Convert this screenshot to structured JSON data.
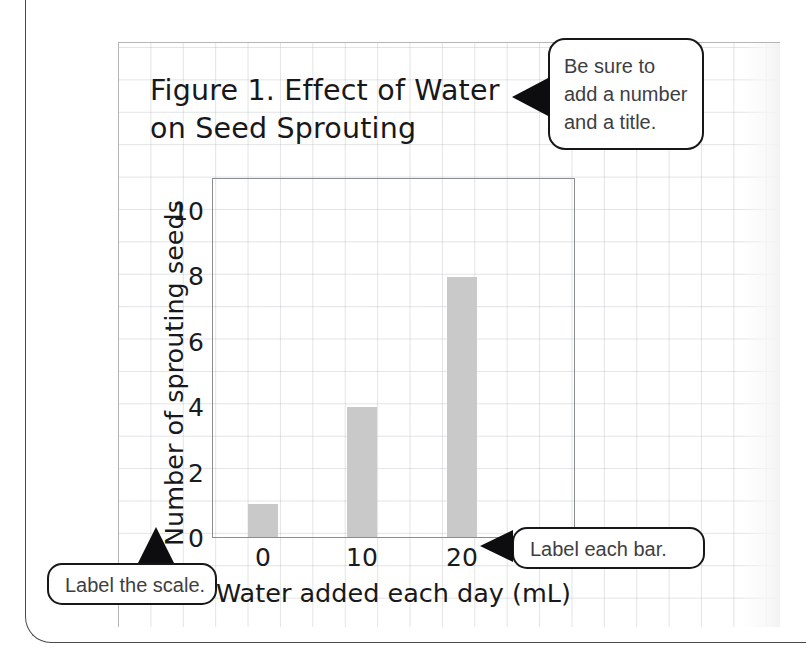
{
  "figure": {
    "title_line1": "Figure 1. Effect of Water",
    "title_line2": "on Seed Sprouting"
  },
  "chart_data": {
    "type": "bar",
    "title": "Figure 1. Effect of Water on Seed Sprouting",
    "categories": [
      "0",
      "10",
      "20"
    ],
    "values": [
      1,
      4,
      8
    ],
    "xlabel": "Water added each day (mL)",
    "ylabel": "Number of sprouting seeds",
    "ylim": [
      0,
      11
    ],
    "yticks": [
      "0",
      "2",
      "4",
      "6",
      "8",
      "10"
    ],
    "ytick_values": [
      0,
      2,
      4,
      6,
      8,
      10
    ],
    "grid": false,
    "legend": false,
    "bar_color": "#c9c9c9",
    "frame_color": "#8b8d8f"
  },
  "callouts": {
    "title_note": {
      "line1": "Be sure to",
      "line2": "add a number",
      "line3": "and a title."
    },
    "scale_note": {
      "text": "Label the scale."
    },
    "bar_note": {
      "text": "Label each bar."
    }
  }
}
